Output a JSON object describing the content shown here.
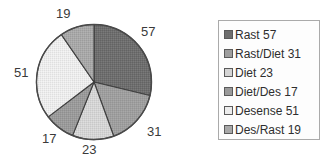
{
  "chart_data": {
    "type": "pie",
    "title": "",
    "labels": [
      "Rast",
      "Rast/Diet",
      "Diet",
      "Diet/Des",
      "Desense",
      "Des/Rast"
    ],
    "values": [
      57,
      31,
      23,
      17,
      51,
      19
    ],
    "total": 198,
    "start_angle_deg": 0,
    "direction": "clockwise",
    "legend_position": "right",
    "grid": false,
    "colors": [
      "#6e6e6e",
      "#9e9e9e",
      "#d4d4d4",
      "#9a9a9a",
      "#ececec",
      "#a8a8a8"
    ],
    "slice_labels": [
      {
        "text": "57",
        "x": 141,
        "y": 24
      },
      {
        "text": "31",
        "x": 147,
        "y": 124
      },
      {
        "text": "23",
        "x": 82,
        "y": 142
      },
      {
        "text": "17",
        "x": 42,
        "y": 131
      },
      {
        "text": "51",
        "x": 14,
        "y": 65
      },
      {
        "text": "19",
        "x": 56,
        "y": 6
      }
    ]
  },
  "legend": {
    "items": [
      {
        "label": "Rast 57",
        "color": "#6e6e6e"
      },
      {
        "label": "Rast/Diet 31",
        "color": "#9e9e9e"
      },
      {
        "label": "Diet 23",
        "color": "#d4d4d4"
      },
      {
        "label": "Diet/Des 17",
        "color": "#9a9a9a"
      },
      {
        "label": "Desense 51",
        "color": "#ececec"
      },
      {
        "label": "Des/Rast 19",
        "color": "#a8a8a8"
      }
    ]
  }
}
